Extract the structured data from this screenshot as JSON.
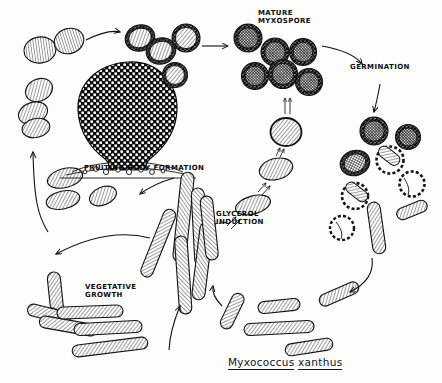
{
  "figure": {
    "species_genus": "Myxococcus",
    "species_epithet": "xanthus",
    "background_color": "#fdfdfc",
    "ink_color": "#111111"
  },
  "labels": {
    "mature_myxospore": "MATURE\nMYXOSPORE",
    "germination": "GERMINATION",
    "fruiting_body": "FRUITING BODY FORMATION",
    "glycerol_induction": "GLYCEROL\nINDUCTION",
    "vegetative_growth": "VEGETATIVE\nGROWTH"
  },
  "stages": [
    {
      "name": "vegetative-growth",
      "label": "VEGETATIVE\nGROWTH",
      "cell_type": "rod",
      "count": 6,
      "region": "bottom-left"
    },
    {
      "name": "fruiting-body-formation",
      "label": "FRUITING BODY FORMATION",
      "cell_type": "aggregate",
      "count": 1,
      "region": "upper-left"
    },
    {
      "name": "mature-myxospore",
      "label": "MATURE\nMYXOSPORE",
      "cell_type": "spore",
      "count": 7,
      "region": "top-right"
    },
    {
      "name": "germination",
      "label": "GERMINATION",
      "cell_type": "germinating-spore",
      "count": 9,
      "region": "right"
    },
    {
      "name": "glycerol-induction",
      "label": "GLYCEROL\nINDUCTION",
      "cell_type": "transition",
      "count": 3,
      "region": "center"
    }
  ],
  "cells": {
    "ovoid_top_left": 4,
    "transition_spores_top": 4,
    "mature_spores": 7,
    "germinating": 9,
    "central_rods": 6,
    "vegetative_rods": 6,
    "bottom_right_rods": 5,
    "left_ovoids": 5
  },
  "arrows": [
    {
      "name": "arrow-to-transition-spores",
      "from": "fruiting-body-release",
      "to": "transition-spores"
    },
    {
      "name": "arrow-to-mature-myxospore",
      "from": "transition-spores",
      "to": "mature-myxospore"
    },
    {
      "name": "arrow-germination-in",
      "from": "mature-myxospore",
      "to": "germination-label"
    },
    {
      "name": "arrow-germination-out",
      "from": "germination-label",
      "to": "germinating-spores"
    },
    {
      "name": "arrow-to-vegetative",
      "from": "germinating-spores",
      "to": "vegetative-rods"
    },
    {
      "name": "arrow-rods-to-center",
      "from": "bottom-right-rods",
      "to": "central-rods"
    },
    {
      "name": "arrow-vegetative-to-center",
      "from": "vegetative-rods",
      "to": "central-rods"
    },
    {
      "name": "arrow-center-to-fruiting",
      "from": "central-rods",
      "to": "fruiting-body"
    },
    {
      "name": "arrow-fruiting-to-ovoids",
      "from": "fruiting-body",
      "to": "left-ovoids"
    },
    {
      "name": "arrow-glycerol-1",
      "from": "rod",
      "to": "ellipse"
    },
    {
      "name": "arrow-glycerol-2",
      "from": "ellipse",
      "to": "round-ellipse"
    },
    {
      "name": "arrow-glycerol-3",
      "from": "round-ellipse",
      "to": "sphere"
    },
    {
      "name": "arrow-glycerol-to-myxospore",
      "from": "sphere",
      "to": "mature-myxospore"
    }
  ]
}
